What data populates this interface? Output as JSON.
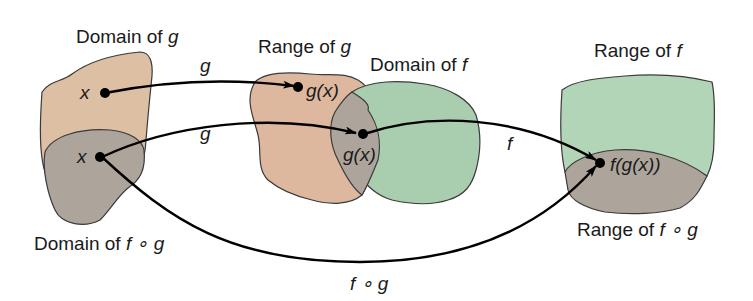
{
  "colors": {
    "domain_g_fill": "#DDC0A4",
    "range_g_fill": "#DDB89E",
    "domain_f_fill": "#A9CDAF",
    "range_f_fill": "#B2D4B7",
    "composite_fill": "#ADA59C",
    "outline": "#3a3a3a",
    "arrow": "#000000"
  },
  "labels": {
    "domain_g": "Domain of g",
    "range_g": "Range of g",
    "domain_f": "Domain of f",
    "range_f": "Range of f",
    "domain_fog": "Domain of f ∘ g",
    "range_fog": "Range of f ∘ g"
  },
  "label_parts": {
    "domain_g": {
      "text": "Domain of ",
      "var": "g"
    },
    "range_g": {
      "text": "Range of ",
      "var": "g"
    },
    "domain_f": {
      "text": "Domain of ",
      "var": "f"
    },
    "range_f": {
      "text": "Range of ",
      "var": "f"
    },
    "domain_fog": {
      "text": "Domain of ",
      "var": "f ∘ g"
    },
    "range_fog": {
      "text": "Range of ",
      "var": "f ∘ g"
    }
  },
  "points": {
    "x_top": "x",
    "x_bottom": "x",
    "gx_top": "g(x)",
    "gx_mid": "g(x)",
    "fgx": "f(g(x))"
  },
  "arrows": {
    "g_top": "g",
    "g_bottom": "g",
    "f": "f",
    "fog": "f ∘ g"
  }
}
